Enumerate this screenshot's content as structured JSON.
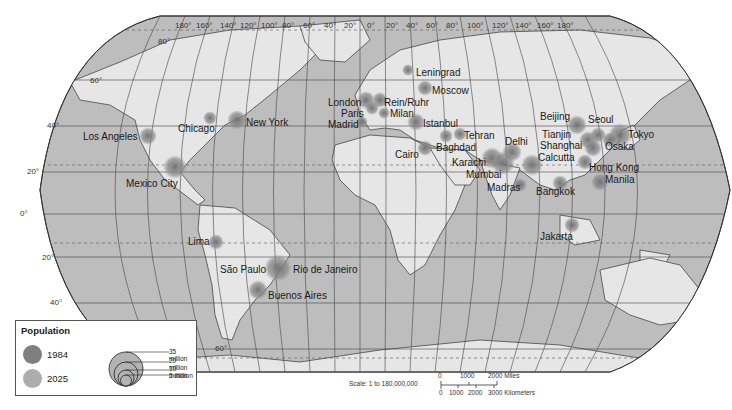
{
  "map": {
    "title": "World Megacities Population",
    "projection": "Robinson",
    "colors": {
      "ocean": "#bdbdbd",
      "land": "#e6e6e6",
      "grid": "#444444",
      "pop_1984": "#7f7f7f",
      "pop_2025": "#a9a9a9"
    },
    "longitude_labels": [
      "180°",
      "160°",
      "140°",
      "120°",
      "100°",
      "80°",
      "60°",
      "40°",
      "20°",
      "0°",
      "20°",
      "40°",
      "60°",
      "80°",
      "100°",
      "120°",
      "140°",
      "160°",
      "180°"
    ],
    "latitude_labels": [
      "80°",
      "60°",
      "40°",
      "20°",
      "0°",
      "20°",
      "40°",
      "60°"
    ],
    "cities": [
      {
        "name": "Leningrad"
      },
      {
        "name": "Moscow"
      },
      {
        "name": "London"
      },
      {
        "name": "Rein/Ruhr"
      },
      {
        "name": "Paris"
      },
      {
        "name": "Milan"
      },
      {
        "name": "Madrid"
      },
      {
        "name": "Istanbul"
      },
      {
        "name": "Tehran"
      },
      {
        "name": "Baghdad"
      },
      {
        "name": "Cairo"
      },
      {
        "name": "Karachi"
      },
      {
        "name": "Mumbai"
      },
      {
        "name": "Delhi"
      },
      {
        "name": "Calcutta"
      },
      {
        "name": "Madras"
      },
      {
        "name": "Bangkok"
      },
      {
        "name": "Jakarta"
      },
      {
        "name": "Beijing"
      },
      {
        "name": "Tianjin"
      },
      {
        "name": "Shanghai"
      },
      {
        "name": "Seoul"
      },
      {
        "name": "Tokyo"
      },
      {
        "name": "Osaka"
      },
      {
        "name": "Hong Kong"
      },
      {
        "name": "Manila"
      },
      {
        "name": "Los Angeles"
      },
      {
        "name": "Chicago"
      },
      {
        "name": "New York"
      },
      {
        "name": "Mexico City"
      },
      {
        "name": "Lima"
      },
      {
        "name": "São Paulo"
      },
      {
        "name": "Rio de Janeiro"
      },
      {
        "name": "Buenos Aires"
      }
    ]
  },
  "legend": {
    "title": "Population",
    "items": [
      {
        "label": "1984",
        "color": "#7f7f7f"
      },
      {
        "label": "2025",
        "color": "#a9a9a9"
      }
    ],
    "sizes": [
      "35 million",
      "20 million",
      "10 million",
      "5 million"
    ]
  },
  "scale": {
    "text": "Scale: 1 to 180,000,000",
    "miles_labels": [
      "0",
      "1000",
      "2000 Miles"
    ],
    "km_labels": [
      "0",
      "1000",
      "2000",
      "3000 Kilometers"
    ]
  }
}
